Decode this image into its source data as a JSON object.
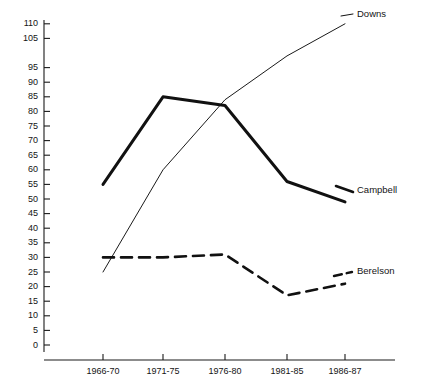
{
  "chart_data": {
    "type": "line",
    "title": "",
    "subtitle": "",
    "xlabel": "",
    "ylabel": "",
    "categories": [
      "1966-70",
      "1971-75",
      "1976-80",
      "1981-85",
      "1986-87"
    ],
    "ylim": [
      0,
      110
    ],
    "ytick_step": 5,
    "yticks": [
      0,
      5,
      10,
      15,
      20,
      25,
      30,
      35,
      40,
      45,
      50,
      55,
      60,
      65,
      70,
      75,
      80,
      85,
      90,
      95,
      105,
      110
    ],
    "ytick_labels": [
      "0",
      "5",
      "10",
      "15",
      "20",
      "25",
      "30",
      "35",
      "40",
      "45",
      "50",
      "55",
      "60",
      "65",
      "70",
      "75",
      "80",
      "85",
      "90",
      "95",
      "105",
      "110"
    ],
    "grid": false,
    "legend_position": "right-inline",
    "series": [
      {
        "name": "Downs",
        "values": [
          25,
          60,
          84,
          99,
          110
        ],
        "style": "thin-solid",
        "color": "#1a1a1a",
        "width": 1
      },
      {
        "name": "Campbell",
        "values": [
          55,
          85,
          82,
          56,
          49
        ],
        "style": "thick-solid",
        "color": "#111111",
        "width": 3
      },
      {
        "name": "Berelson",
        "values": [
          30,
          30,
          31,
          17,
          21
        ],
        "style": "dashed",
        "color": "#111111",
        "width": 2.6
      }
    ]
  },
  "labels": {
    "downs": "Downs",
    "campbell": "Campbell",
    "berelson": "Berelson"
  },
  "colors": {
    "axis": "#1a1a1a",
    "text": "#141414",
    "background": "#ffffff"
  }
}
